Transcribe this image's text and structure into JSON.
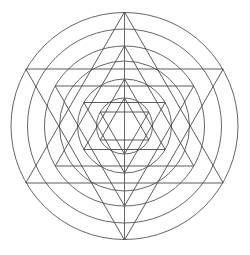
{
  "figure": {
    "background_color": "#ffffff",
    "stroke_color": "#4a4a4e",
    "circle_stroke_color": "#555558",
    "stroke_width": 0.9
  },
  "chart_data": {
    "type": "scatter",
    "xlabel": "",
    "ylabel": "",
    "grid": false,
    "legend": "none",
    "xlim": [
      0,
      250
    ],
    "ylim": [
      0,
      255
    ],
    "center": {
      "x": 124.5,
      "y": 126.0
    },
    "circles": [
      {
        "name": "circle-1-outer",
        "radius": 113.5
      },
      {
        "name": "circle-2",
        "radius": 97.0
      },
      {
        "name": "circle-3",
        "radius": 80.0
      },
      {
        "name": "circle-4",
        "radius": 65.0
      },
      {
        "name": "circle-5",
        "radius": 47.0
      },
      {
        "name": "circle-6-inner",
        "radius": 28.0
      }
    ],
    "stars": [
      {
        "name": "hexagram-1-outer",
        "points": 6,
        "circumradius": 114.0,
        "rotation_deg": -90
      },
      {
        "name": "hexagram-2",
        "points": 6,
        "circumradius": 80.0,
        "rotation_deg": -90
      },
      {
        "name": "hexagram-3",
        "points": 6,
        "circumradius": 47.0,
        "rotation_deg": -90
      },
      {
        "name": "hexagram-4-inner",
        "points": 6,
        "circumradius": 28.0,
        "rotation_deg": -90
      }
    ],
    "axis_lines": [
      {
        "name": "vertical-axis",
        "x1": 124.5,
        "y1": 12.5,
        "x2": 124.5,
        "y2": 239.5
      }
    ],
    "vertices_outer_star": [
      {
        "label": "top",
        "x": 124.5,
        "y": 12.0
      },
      {
        "label": "upper-right",
        "x": 223.2,
        "y": 69.0
      },
      {
        "label": "lower-right",
        "x": 223.2,
        "y": 183.0
      },
      {
        "label": "bottom",
        "x": 124.5,
        "y": 240.0
      },
      {
        "label": "lower-left",
        "x": 25.8,
        "y": 183.0
      },
      {
        "label": "upper-left",
        "x": 25.8,
        "y": 69.0
      }
    ]
  }
}
